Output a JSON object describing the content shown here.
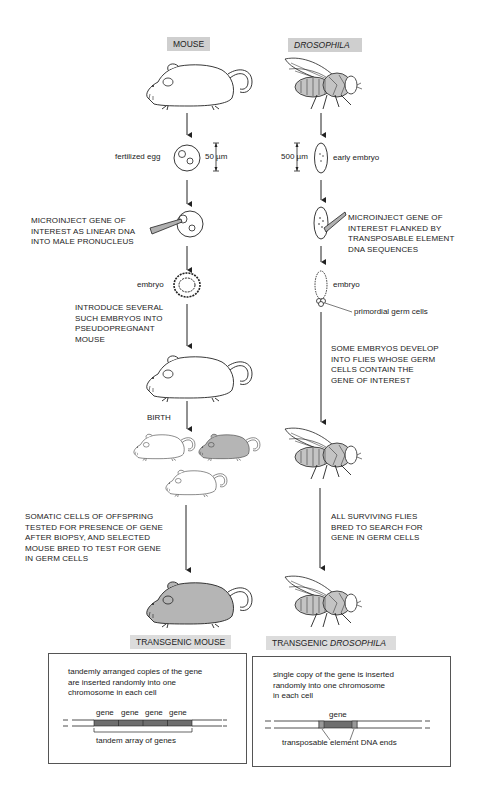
{
  "headers": {
    "mouse": "MOUSE",
    "drosophila": "DROSOPHILA"
  },
  "mouse_column": {
    "egg_label": "fertilized egg",
    "egg_scale": "50 µm",
    "microinject_text": "MICROINJECT GENE OF\nINTEREST AS LINEAR DNA\nINTO MALE PRONUCLEUS",
    "embryo_label": "embryo",
    "introduce_text": "INTRODUCE SEVERAL\nSUCH EMBRYOS INTO\nPSEUDOPREGNANT\nMOUSE",
    "birth_label": "BIRTH",
    "somatic_text": "SOMATIC CELLS OF OFFSPRING\nTESTED FOR PRESENCE OF GENE\nAFTER BIOPSY, AND SELECTED\nMOUSE BRED TO TEST FOR GENE\nIN GERM CELLS",
    "result_label": "TRANSGENIC MOUSE"
  },
  "fly_column": {
    "embryo_scale": "500 µm",
    "early_embryo_label": "early embryo",
    "microinject_text": "MICROINJECT GENE OF\nINTEREST FLANKED BY\nTRANSPOSABLE ELEMENT\nDNA SEQUENCES",
    "embryo_label": "embryo",
    "germ_cells_label": "primordial germ cells",
    "develop_text": "SOME EMBRYOS DEVELOP\nINTO FLIES WHOSE GERM\nCELLS CONTAIN THE\nGENE OF INTEREST",
    "bred_text": "ALL SURVIVING FLIES\nBRED TO SEARCH FOR\nGENE IN GERM CELLS",
    "result_label_prefix": "TRANSGENIC ",
    "result_label_italic": "DROSOPHILA"
  },
  "mouse_box": {
    "description": "tandemly arranged copies of the gene\nare inserted randomly into one\nchromosome in each cell",
    "gene_labels": [
      "gene",
      "gene",
      "gene",
      "gene"
    ],
    "array_label": "tandem array of genes"
  },
  "fly_box": {
    "description": "single copy of the gene is inserted\nrandomly into one chromosome\nin each cell",
    "gene_label": "gene",
    "ends_label": "transposable element DNA ends"
  },
  "colors": {
    "label_bg": "#cfcfcf",
    "gene_fill": "#6e6e6e",
    "transgenic_fill": "#b5b5b5",
    "fly_body": "#c4c4c4"
  }
}
